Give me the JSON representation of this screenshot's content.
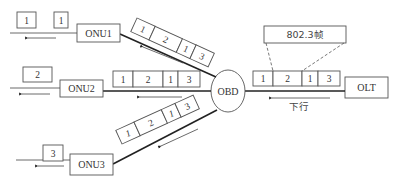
{
  "diagram": {
    "type": "EPON downstream broadcast",
    "nodes": {
      "olt": {
        "label": "OLT"
      },
      "obd": {
        "label": "OBD"
      },
      "onu1": {
        "label": "ONU1"
      },
      "onu2": {
        "label": "ONU2"
      },
      "onu3": {
        "label": "ONU3"
      }
    },
    "frame_label": "802.3帧",
    "direction_label": "下行",
    "broadcast_frame_cells": [
      "1",
      "2",
      "1",
      "3"
    ],
    "onu1_received": [
      "1",
      "1"
    ],
    "onu2_received": [
      "2"
    ],
    "onu3_received": [
      "3"
    ]
  },
  "colors": {
    "stroke": "#555555",
    "line": "#222222",
    "text": "#333333",
    "background": "#ffffff"
  }
}
